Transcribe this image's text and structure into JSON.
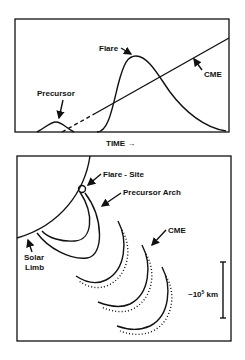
{
  "top_panel": {
    "labels": {
      "flare": "Flare",
      "cme": "CME",
      "precursor": "Precursor"
    },
    "x_axis_label": "TIME →"
  },
  "bottom_panel": {
    "labels": {
      "flare_site": "Flare - Site",
      "precursor_arch": "Precursor Arch",
      "cme": "CME",
      "solar_limb_line1": "Solar",
      "solar_limb_line2": "Limb",
      "scale": "~10",
      "scale_exp": "5",
      "scale_unit": " km"
    }
  },
  "colors": {
    "ink": "#111111",
    "background": "#ffffff"
  }
}
